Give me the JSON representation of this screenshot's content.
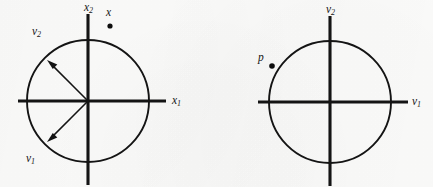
{
  "figure": {
    "background_color": "#fbfbfa",
    "ink_color": "#141414",
    "clipped_header_text": "",
    "panels": [
      {
        "id": "left-panel",
        "name": "original-coordinate-frame",
        "center": {
          "x": 88,
          "y": 101
        },
        "radius": 61,
        "axes": {
          "horizontal": {
            "label": "x",
            "subscript": "1",
            "label_x": 172,
            "label_y": 104,
            "x_start": 18,
            "x_end": 166
          },
          "vertical": {
            "label": "x",
            "subscript": "2",
            "label_x": 84,
            "label_y": 11,
            "y_start": 14,
            "y_end": 185
          }
        },
        "points": [
          {
            "name": "x",
            "label": "x",
            "subscript": "",
            "dot_x": 110,
            "dot_y": 26,
            "label_x": 106,
            "label_y": 16,
            "radius": 2.6
          }
        ],
        "vectors": [
          {
            "name": "v2",
            "label": "v",
            "subscript": "2",
            "angle_deg": 135,
            "length": 58,
            "label_x": 32,
            "label_y": 35
          },
          {
            "name": "v1",
            "label": "v",
            "subscript": "1",
            "angle_deg": 225,
            "length": 58,
            "label_x": 26,
            "label_y": 162
          }
        ]
      },
      {
        "id": "right-panel",
        "name": "rotated-coordinate-frame",
        "center": {
          "x": 330,
          "y": 102
        },
        "radius": 61,
        "axes": {
          "horizontal": {
            "label": "v",
            "subscript": "1",
            "label_x": 412,
            "label_y": 105,
            "x_start": 258,
            "x_end": 408
          },
          "vertical": {
            "label": "v",
            "subscript": "2",
            "label_x": 326,
            "label_y": 13,
            "y_start": 16,
            "y_end": 186
          }
        },
        "points": [
          {
            "name": "p",
            "label": "p",
            "subscript": "",
            "dot_x": 272,
            "dot_y": 66,
            "label_x": 258,
            "label_y": 61,
            "radius": 2.8
          }
        ],
        "vectors": []
      }
    ]
  }
}
